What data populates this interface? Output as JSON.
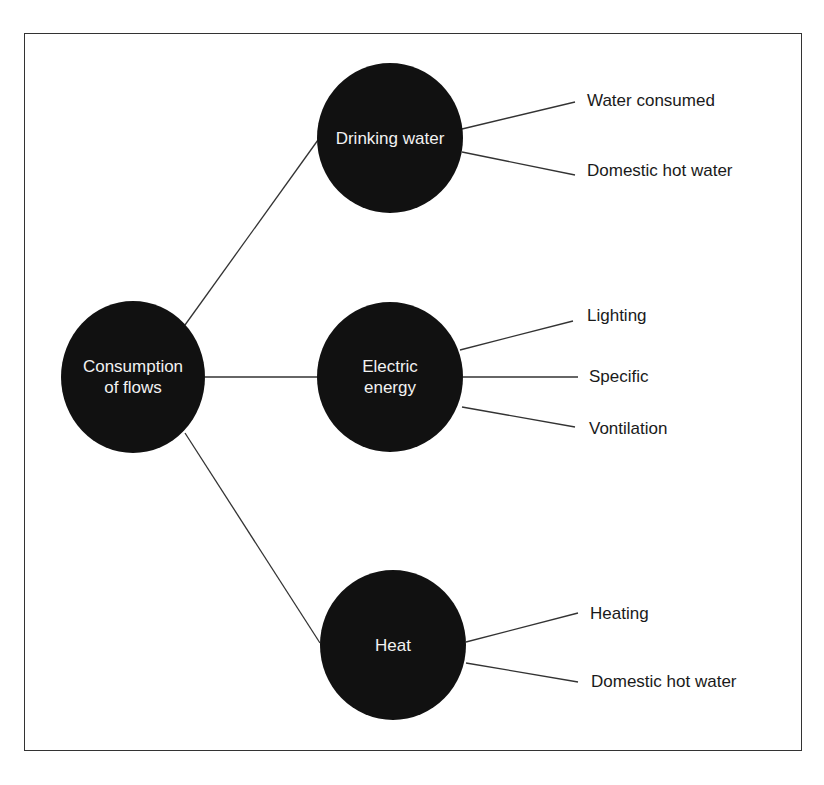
{
  "diagram": {
    "root": {
      "label_line1": "Consumption",
      "label_line2": "of flows"
    },
    "branches": [
      {
        "label_line1": "Drinking water",
        "label_line2": "",
        "leaves": [
          "Water consumed",
          "Domestic hot water"
        ]
      },
      {
        "label_line1": "Electric",
        "label_line2": "energy",
        "leaves": [
          "Lighting",
          "Specific",
          "Vontilation"
        ]
      },
      {
        "label_line1": "Heat",
        "label_line2": "",
        "leaves": [
          "Heating",
          "Domestic hot water"
        ]
      }
    ]
  },
  "colors": {
    "node_fill": "#111111",
    "node_text": "#f2f2f2",
    "line": "#333333",
    "leaf_text": "#1a1a1a"
  }
}
